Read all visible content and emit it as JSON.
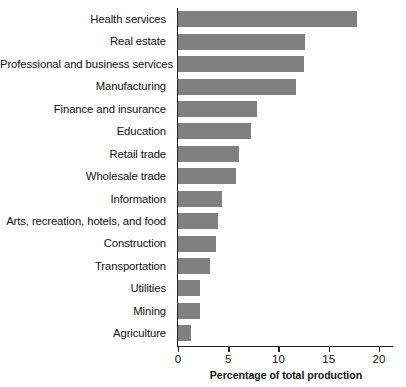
{
  "chart_data": {
    "type": "bar",
    "orientation": "horizontal",
    "title": "",
    "subtitle": "",
    "xlabel": "Percentage of total production",
    "ylabel": "",
    "xlim": [
      0,
      21.5
    ],
    "xticks": [
      0,
      5,
      10,
      15,
      20
    ],
    "xtick_labels": [
      "0",
      "5",
      "10",
      "15",
      "20"
    ],
    "grid": false,
    "legend": null,
    "bar_color": "#808080",
    "axis_color": "#222222",
    "categories": [
      "Health services",
      "Real estate",
      "Professional and business services",
      "Manufacturing",
      "Finance and insurance",
      "Education",
      "Retail trade",
      "Wholesale trade",
      "Information",
      "Arts, recreation, hotels, and food",
      "Construction",
      "Transportation",
      "Utilities",
      "Mining",
      "Agriculture"
    ],
    "values": [
      17.8,
      12.6,
      12.5,
      11.7,
      7.9,
      7.3,
      6.1,
      5.8,
      4.4,
      4.0,
      3.8,
      3.2,
      2.2,
      2.2,
      1.3
    ]
  }
}
